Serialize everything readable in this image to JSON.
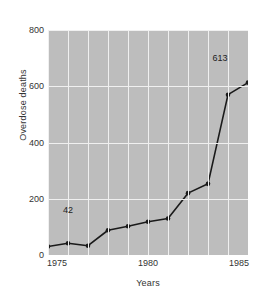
{
  "chart_data": {
    "type": "line",
    "title": "",
    "xlabel": "Years",
    "ylabel": "Overdose deaths",
    "xlim": [
      1975,
      1985
    ],
    "ylim": [
      0,
      800
    ],
    "xticks": [
      1975,
      1980,
      1985
    ],
    "xtick_labels": [
      "1975",
      "1980",
      "1985"
    ],
    "yticks": [
      0,
      200,
      400,
      600,
      800
    ],
    "ytick_labels": [
      "0",
      "200",
      "400",
      "600",
      "800"
    ],
    "grid": "white gridlines on gray plot background, vertical at every year, horizontal at every y tick",
    "legend": "none",
    "x": [
      1975,
      1976,
      1977,
      1978,
      1979,
      1980,
      1981,
      1982,
      1983,
      1984,
      1985
    ],
    "values": [
      30,
      42,
      33,
      88,
      102,
      118,
      130,
      220,
      253,
      570,
      613
    ],
    "series": [
      {
        "name": "Overdose deaths",
        "values": [
          30,
          42,
          33,
          88,
          102,
          118,
          130,
          220,
          253,
          570,
          613
        ]
      }
    ],
    "marker": "filled circle",
    "line_color": "#1a1a1a",
    "plot_background": "#bdbdbd",
    "gridline_color": "#f0f0f0",
    "annotations": [
      {
        "text": "42",
        "x": 1976,
        "y": 160
      },
      {
        "text": "613",
        "x": 1983.6,
        "y": 700
      }
    ]
  },
  "figure": {
    "background": "#ffffff"
  }
}
